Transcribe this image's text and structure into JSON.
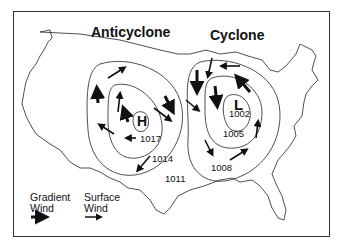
{
  "diagram": {
    "title_left": "Anticyclone",
    "title_right": "Cyclone",
    "high_symbol": "H",
    "low_symbol": "L",
    "isobars": {
      "anticyclone": [
        "1017",
        "1014",
        "1011"
      ],
      "cyclone": [
        "1002",
        "1005",
        "1008"
      ]
    },
    "legend": {
      "gradient_line1": "Gradient",
      "gradient_line2": "Wind",
      "surface_line1": "Surface",
      "surface_line2": "Wind"
    },
    "colors": {
      "ink": "#111111",
      "background": "#ffffff",
      "border": "#333333"
    }
  }
}
